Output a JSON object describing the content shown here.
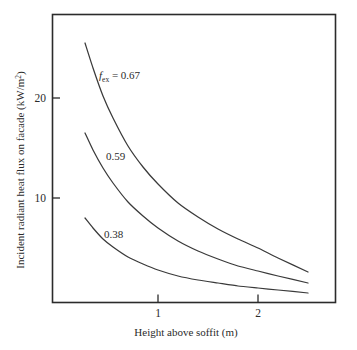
{
  "chart_data": {
    "type": "line",
    "title": "",
    "xlabel": "Height above soffit (m)",
    "ylabel": "Incident radiant heat flux on facade (kW/m²)",
    "ylabel_main": "Incident radiant heat flux on facade (kW/m",
    "ylabel_sup": "2",
    "ylabel_tail": ")",
    "xlim": [
      -0.06,
      2.86
    ],
    "ylim": [
      0,
      29.4
    ],
    "grid": false,
    "legend": "inline-curve-labels",
    "xticks": [
      1,
      2
    ],
    "xtick_labels": [
      "1",
      "2"
    ],
    "yticks": [
      10,
      20
    ],
    "ytick_labels": [
      "10",
      "20"
    ],
    "series": [
      {
        "name": "f_ex = 0.67",
        "label_prefix_italic": "f",
        "label_subscript": "ex",
        "label_value": " = 0.67",
        "f_ex": 0.67,
        "x": [
          0.27,
          0.35,
          0.45,
          0.55,
          0.7,
          0.85,
          1.0,
          1.2,
          1.4,
          1.6,
          1.8,
          2.0,
          2.2,
          2.5
        ],
        "y": [
          25.5,
          23.0,
          20.2,
          18.0,
          15.2,
          13.1,
          11.4,
          9.5,
          8.1,
          6.9,
          5.9,
          5.0,
          4.0,
          2.6
        ]
      },
      {
        "name": "0.59",
        "label_value": "0.59",
        "f_ex": 0.59,
        "x": [
          0.27,
          0.35,
          0.45,
          0.55,
          0.7,
          0.85,
          1.0,
          1.2,
          1.4,
          1.6,
          1.8,
          2.0,
          2.2,
          2.5
        ],
        "y": [
          16.5,
          14.8,
          13.0,
          11.5,
          9.6,
          8.2,
          7.0,
          5.7,
          4.7,
          3.9,
          3.2,
          2.7,
          2.2,
          1.5
        ]
      },
      {
        "name": "0.38",
        "label_value": "0.38",
        "f_ex": 0.38,
        "x": [
          0.27,
          0.35,
          0.45,
          0.55,
          0.7,
          0.85,
          1.0,
          1.2,
          1.4,
          1.6,
          1.8,
          2.0,
          2.2,
          2.5
        ],
        "y": [
          8.0,
          7.0,
          5.9,
          5.1,
          4.1,
          3.4,
          2.8,
          2.2,
          1.8,
          1.5,
          1.2,
          1.0,
          0.8,
          0.5
        ]
      }
    ],
    "curve_label_positions": [
      {
        "label": "f_ex = 0.67",
        "x": 0.35,
        "y": 22.3
      },
      {
        "label": "0.59",
        "x": 0.42,
        "y": 14.2
      },
      {
        "label": "0.38",
        "x": 0.4,
        "y": 6.4
      }
    ]
  }
}
